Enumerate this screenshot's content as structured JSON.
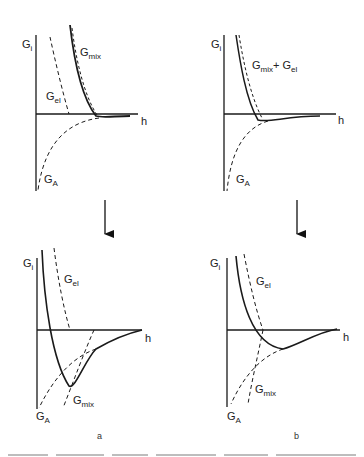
{
  "figure": {
    "panels": [
      {
        "id": "top-left",
        "y_axis_label": {
          "main": "G",
          "sub": "i"
        },
        "x_axis_label": "h",
        "curves": [
          {
            "name": "G_mix",
            "label_main": "G",
            "label_sub": "mix",
            "style": "solid"
          },
          {
            "name": "G_el",
            "label_main": "G",
            "label_sub": "el",
            "style": "dashed"
          },
          {
            "name": "G_A",
            "label_main": "G",
            "label_sub": "A",
            "style": "dashed"
          }
        ]
      },
      {
        "id": "top-right",
        "y_axis_label": {
          "main": "G",
          "sub": "i"
        },
        "x_axis_label": "h",
        "curves": [
          {
            "name": "G_mix + G_el",
            "label_main": "G",
            "label_sub": "mix",
            "label_plus": "+ G",
            "label_sub2": "el",
            "style": "solid"
          },
          {
            "name": "G_A",
            "label_main": "G",
            "label_sub": "A",
            "style": "dashed"
          }
        ]
      },
      {
        "id": "bottom-left",
        "letter": "a",
        "y_axis_label": {
          "main": "G",
          "sub": "i"
        },
        "x_axis_label": "h",
        "curves": [
          {
            "name": "G_el",
            "label_main": "G",
            "label_sub": "el",
            "style": "dashed"
          },
          {
            "name": "G_mix",
            "label_main": "G",
            "label_sub": "mix",
            "style": "dashed"
          },
          {
            "name": "G_A",
            "label_main": "G",
            "label_sub": "A",
            "style": "dashed"
          },
          {
            "name": "total",
            "style": "solid"
          }
        ]
      },
      {
        "id": "bottom-right",
        "letter": "b",
        "y_axis_label": {
          "main": "G",
          "sub": "i"
        },
        "x_axis_label": "h",
        "curves": [
          {
            "name": "G_el",
            "label_main": "G",
            "label_sub": "el",
            "style": "dashed"
          },
          {
            "name": "G_mix",
            "label_main": "G",
            "label_sub": "mix",
            "style": "dashed"
          },
          {
            "name": "G_A",
            "label_main": "G",
            "label_sub": "A",
            "style": "dashed"
          },
          {
            "name": "total",
            "style": "solid"
          }
        ]
      }
    ],
    "arrows": [
      {
        "from": "top-left",
        "to": "bottom-left",
        "direction": "down"
      },
      {
        "from": "top-right",
        "to": "bottom-right",
        "direction": "down"
      }
    ],
    "colors": {
      "ink": "#1a1a1a",
      "background": "#ffffff"
    }
  }
}
